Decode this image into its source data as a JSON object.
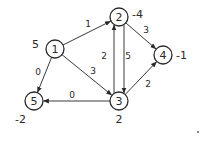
{
  "diagram": {
    "type": "directed-weighted-graph",
    "nodes": [
      {
        "id": "1",
        "label": "1",
        "value": "5"
      },
      {
        "id": "2",
        "label": "2",
        "value": "-4"
      },
      {
        "id": "3",
        "label": "3",
        "value": "2"
      },
      {
        "id": "4",
        "label": "4",
        "value": "-1"
      },
      {
        "id": "5",
        "label": "5",
        "value": "-2"
      }
    ],
    "edges": [
      {
        "from": "1",
        "to": "2",
        "weight": "1"
      },
      {
        "from": "1",
        "to": "3",
        "weight": "3"
      },
      {
        "from": "1",
        "to": "5",
        "weight": "0"
      },
      {
        "from": "3",
        "to": "5",
        "weight": "0"
      },
      {
        "from": "3",
        "to": "2",
        "weight": "2"
      },
      {
        "from": "2",
        "to": "3",
        "weight": "5"
      },
      {
        "from": "2",
        "to": "4",
        "weight": "3"
      },
      {
        "from": "3",
        "to": "4",
        "weight": "2"
      }
    ]
  }
}
